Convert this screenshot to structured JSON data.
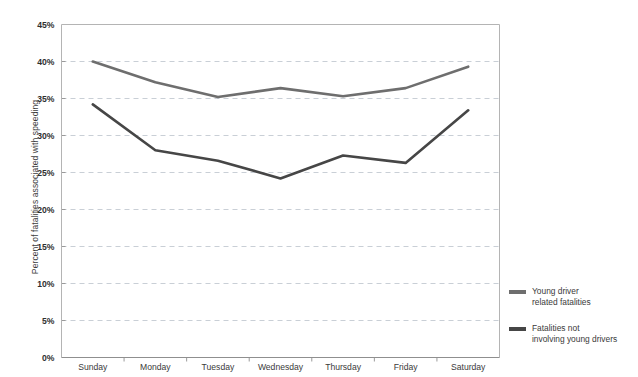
{
  "chart_data": {
    "type": "line",
    "title": "",
    "xlabel": "",
    "ylabel": "Percent of fatalities associated with speeding",
    "categories": [
      "Sunday",
      "Monday",
      "Tuesday",
      "Wednesday",
      "Thursday",
      "Friday",
      "Saturday"
    ],
    "ylim": [
      0,
      45
    ],
    "ytick_labels": [
      "0%",
      "5%",
      "10%",
      "15%",
      "20%",
      "25%",
      "30%",
      "35%",
      "40%",
      "45%"
    ],
    "ytick_values": [
      0,
      5,
      10,
      15,
      20,
      25,
      30,
      35,
      40,
      45
    ],
    "grid": "horizontal-dashed",
    "legend_position": "right",
    "series": [
      {
        "name": "Young driver\nrelated fatalities",
        "color": "#6e6e6e",
        "values": [
          40.0,
          37.2,
          35.2,
          36.4,
          35.3,
          36.4,
          39.3
        ]
      },
      {
        "name": "Fatalities not\ninvolving young drivers",
        "color": "#464646",
        "values": [
          34.2,
          28.0,
          26.6,
          24.2,
          27.3,
          26.3,
          33.4
        ]
      }
    ]
  },
  "axis": {
    "y_title": "Percent of fatalities associated with speeding"
  },
  "legend": {
    "items": [
      {
        "label": "Young driver\nrelated fatalities",
        "color": "#6e6e6e"
      },
      {
        "label": "Fatalities not\ninvolving young drivers",
        "color": "#464646"
      }
    ]
  },
  "colors": {
    "plot_border": "#b4b4b4",
    "gridline": "#c9cfd6",
    "series_1": "#6e6e6e",
    "series_2": "#464646",
    "background": "#ffffff"
  }
}
